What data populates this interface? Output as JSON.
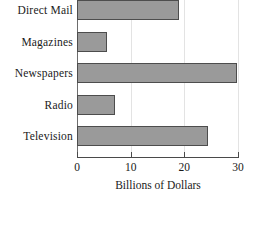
{
  "chart_data": {
    "type": "bar",
    "orientation": "horizontal",
    "title": "",
    "xlabel": "Billions of Dollars",
    "ylabel": "",
    "categories": [
      "Direct Mail",
      "Magazines",
      "Newspapers",
      "Radio",
      "Television"
    ],
    "values": [
      19,
      5.6,
      29.8,
      7,
      24.5
    ],
    "xlim": [
      0,
      30
    ],
    "xticks": [
      0,
      10,
      20,
      30
    ],
    "xtick_labels": [
      "0",
      "10",
      "20",
      "30"
    ],
    "grid": true,
    "grid_axis": "x",
    "legend": null,
    "bar_color": "#9a9a9a",
    "bar_edge_color": "#4d4d4d",
    "background_color": "#ffffff",
    "axis_color": "#4a4a4a",
    "gridline_color": "#e3e3e3"
  }
}
